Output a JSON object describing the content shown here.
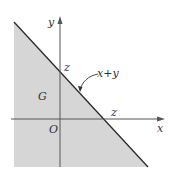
{
  "diagram": {
    "colors": {
      "region_fill": "#d6d6d6",
      "line": "#2a2a2a",
      "axis": "#555555",
      "text": "#333333"
    },
    "axes": {
      "x_label": "x",
      "y_label": "y",
      "origin_label": "O"
    },
    "region": {
      "label": "G"
    },
    "line": {
      "label": "x+y"
    },
    "intercepts": {
      "y_intercept_label": "z",
      "x_intercept_label": "z"
    }
  }
}
